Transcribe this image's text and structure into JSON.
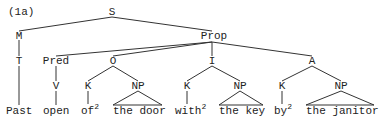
{
  "example_label": "(1a)",
  "nodes": {
    "S": "S",
    "M": "M",
    "T": "T",
    "Prop": "Prop",
    "Pred": "Pred",
    "V": "V",
    "O": "O",
    "O_K": "K",
    "O_NP": "NP",
    "I": "I",
    "I_K": "K",
    "I_NP": "NP",
    "A": "A",
    "A_K": "K",
    "A_NP": "NP"
  },
  "leaves": {
    "past": "Past",
    "open": "open",
    "of": "of",
    "of_sup": "2",
    "the_door": "the door",
    "with": "with",
    "with_sup": "2",
    "the_key": "the key",
    "by": "by",
    "by_sup": "2",
    "the_janitor": "the janitor"
  },
  "colors": {
    "line": "#333333",
    "text": "#222222",
    "background": "#ffffff"
  }
}
